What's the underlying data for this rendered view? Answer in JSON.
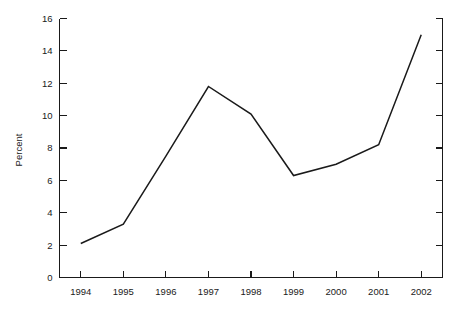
{
  "chart_data": {
    "type": "line",
    "title": "",
    "subtitle": "",
    "xlabel": "",
    "ylabel": "Percent",
    "categories": [
      "1994",
      "1995",
      "1996",
      "1997",
      "1998",
      "1999",
      "2000",
      "2001",
      "2002"
    ],
    "x": [
      1994,
      1995,
      1996,
      1997,
      1998,
      1999,
      2000,
      2001,
      2002
    ],
    "values": [
      2.1,
      3.3,
      7.5,
      11.8,
      10.1,
      6.3,
      7.0,
      8.2,
      15.0
    ],
    "series": [
      {
        "name": "Percent",
        "values": [
          2.1,
          3.3,
          7.5,
          11.8,
          10.1,
          6.3,
          7.0,
          8.2,
          15.0
        ],
        "color": "#1a1a1a"
      }
    ],
    "ylim": [
      0,
      16
    ],
    "yticks": [
      0,
      2,
      4,
      6,
      8,
      10,
      12,
      14,
      16
    ],
    "ytick_labels": [
      "0",
      "2",
      "4",
      "6",
      "8",
      "10",
      "12",
      "14",
      "16"
    ],
    "xtick_labels": [
      "1994",
      "1995",
      "1996",
      "1997",
      "1998",
      "1999",
      "2000",
      "2001",
      "2002"
    ],
    "grid": false,
    "legend": "none",
    "line_color": "#1a1a1a",
    "background_color": "#ffffff",
    "markers": false,
    "axis_style": "left-right-ticks-inward"
  }
}
